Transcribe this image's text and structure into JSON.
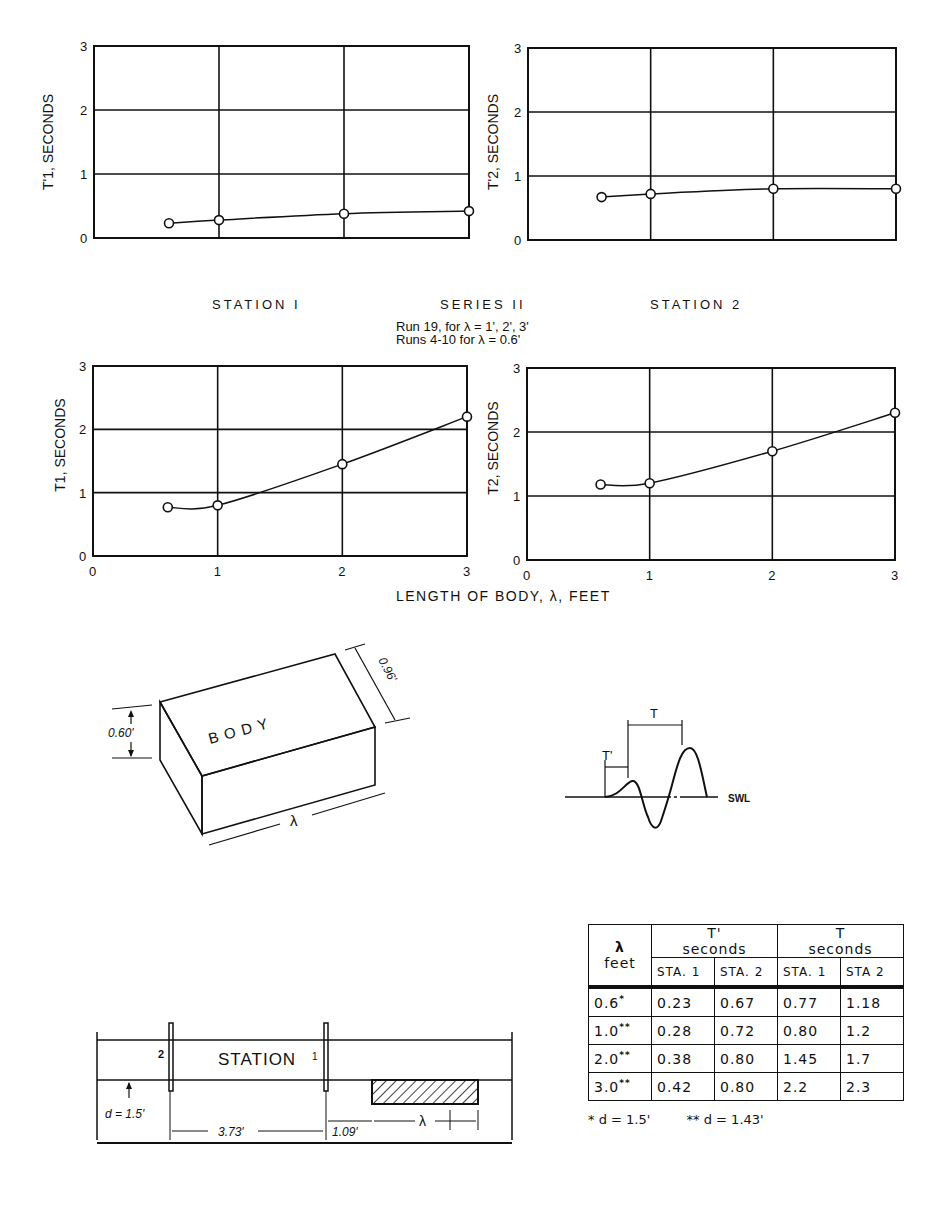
{
  "figure": {
    "series_label": "SERIES II",
    "station1_label": "STATION I",
    "station2_label": "STATION 2",
    "run_note_1": "Run 19, for λ = 1', 2', 3'",
    "run_note_2": "Runs 4-10 for λ = 0.6'",
    "x_axis_label": "LENGTH OF BODY, λ, FEET"
  },
  "chart_data": [
    {
      "type": "line",
      "id": "t1prime",
      "title": "Station 1",
      "ylabel": "T'1, SECONDS",
      "xlabel": "",
      "x": [
        0.6,
        1.0,
        2.0,
        3.0
      ],
      "values": [
        0.23,
        0.28,
        0.38,
        0.42
      ],
      "xlim": [
        0,
        3
      ],
      "ylim": [
        0,
        3
      ],
      "yticks": [
        "0",
        "1",
        "2",
        "3"
      ],
      "xticks": [],
      "grid": true
    },
    {
      "type": "line",
      "id": "t2prime",
      "title": "Station 2",
      "ylabel": "T'2, SECONDS",
      "xlabel": "",
      "x": [
        0.6,
        1.0,
        2.0,
        3.0
      ],
      "values": [
        0.67,
        0.72,
        0.8,
        0.8
      ],
      "xlim": [
        0,
        3
      ],
      "ylim": [
        0,
        3
      ],
      "yticks": [
        "0",
        "1",
        "2",
        "3"
      ],
      "xticks": [],
      "grid": true
    },
    {
      "type": "line",
      "id": "t1",
      "title": "Station 1",
      "ylabel": "T1, SECONDS",
      "xlabel": "LENGTH OF BODY, λ, FEET",
      "x": [
        0.6,
        1.0,
        2.0,
        3.0
      ],
      "values": [
        0.77,
        0.8,
        1.45,
        2.2
      ],
      "xlim": [
        0,
        3
      ],
      "ylim": [
        0,
        3
      ],
      "yticks": [
        "0",
        "1",
        "2",
        "3"
      ],
      "xticks": [
        "0",
        "1",
        "2",
        "3"
      ],
      "grid": true
    },
    {
      "type": "line",
      "id": "t2",
      "title": "Station 2",
      "ylabel": "T2, SECONDS",
      "xlabel": "LENGTH OF BODY, λ, FEET",
      "x": [
        0.6,
        1.0,
        2.0,
        3.0
      ],
      "values": [
        1.18,
        1.2,
        1.7,
        2.3
      ],
      "xlim": [
        0,
        3
      ],
      "ylim": [
        0,
        3
      ],
      "yticks": [
        "0",
        "1",
        "2",
        "3"
      ],
      "xticks": [
        "0",
        "1",
        "2",
        "3"
      ],
      "grid": true
    }
  ],
  "body_diagram": {
    "label": "B O D Y",
    "height_dim": "0.60'",
    "width_dim": "0.96'",
    "length_dim": "λ"
  },
  "wave_diagram": {
    "t_label": "T",
    "tprime_label": "T'",
    "swl_label": "SWL"
  },
  "channel_diagram": {
    "station_label": "STATION",
    "gauge1_label": "1",
    "gauge2_label": "2",
    "depth_label": "d = 1.5'",
    "spacing_label": "3.73'",
    "offset_label": "1.09'",
    "length_label": "λ"
  },
  "table": {
    "col_lambda": "λ",
    "col_lambda_unit": "feet",
    "group1_title": "T'",
    "group1_unit": "seconds",
    "group2_title": "T",
    "group2_unit": "seconds",
    "sub_headers": [
      "STA. 1",
      "STA. 2",
      "STA. 1",
      "STA 2"
    ],
    "rows": [
      {
        "lambda": "0.6",
        "mark": "*",
        "t1p": "0.23",
        "t2p": "0.67",
        "t1": "0.77",
        "t2": "1.18"
      },
      {
        "lambda": "1.0",
        "mark": "**",
        "t1p": "0.28",
        "t2p": "0.72",
        "t1": "0.80",
        "t2": "1.2"
      },
      {
        "lambda": "2.0",
        "mark": "**",
        "t1p": "0.38",
        "t2p": "0.80",
        "t1": "1.45",
        "t2": "1.7"
      },
      {
        "lambda": "3.0",
        "mark": "**",
        "t1p": "0.42",
        "t2p": "0.80",
        "t1": "2.2",
        "t2": "2.3"
      }
    ],
    "footnote_1": "* d = 1.5'",
    "footnote_2": "** d = 1.43'"
  }
}
